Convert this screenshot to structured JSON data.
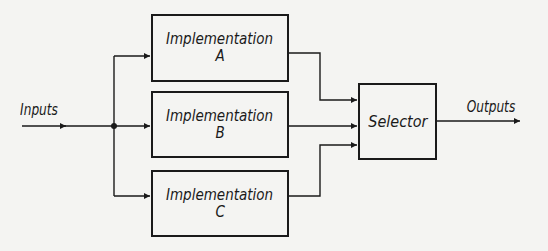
{
  "diagram": {
    "input_label": "Inputs",
    "output_label": "Outputs",
    "implementations": [
      {
        "title": "Implementation",
        "letter": "A"
      },
      {
        "title": "Implementation",
        "letter": "B"
      },
      {
        "title": "Implementation",
        "letter": "C"
      }
    ],
    "selector_label": "Selector",
    "colors": {
      "line": "#1a1a1a",
      "background": "#f4f4f2"
    }
  }
}
